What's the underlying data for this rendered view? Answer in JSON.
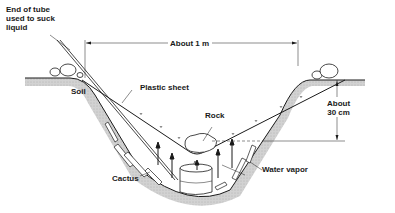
{
  "diagram": {
    "type": "cross-section",
    "colors": {
      "ink": "#1a1a1a",
      "soil": "#c8c8c8",
      "background": "#ffffff"
    },
    "labels": {
      "tube": "End of tube used to suck liquid",
      "tube_line1": "End of tube",
      "tube_line2": "used to suck",
      "tube_line3": "liquid",
      "width": "About 1 m",
      "soil": "Soil",
      "plastic_sheet": "Plastic sheet",
      "rock": "Rock",
      "depth_line1": "About",
      "depth_line2": "30 cm",
      "cactus": "Cactus",
      "water_vapor": "Water vapor"
    }
  }
}
